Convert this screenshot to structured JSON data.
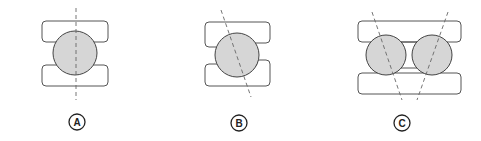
{
  "figures": [
    {
      "id": "A",
      "label": "A",
      "description": "single row bearing, contact axis vertical"
    },
    {
      "id": "B",
      "label": "B",
      "description": "single row angular contact bearing, tilted contact axis"
    },
    {
      "id": "C",
      "label": "C",
      "description": "double row angular contact bearing, converging contact axes"
    }
  ],
  "colors": {
    "ball_fill": "#d6d6d6",
    "outline": "#444444",
    "axis_line": "#666666",
    "background": "#ffffff"
  }
}
